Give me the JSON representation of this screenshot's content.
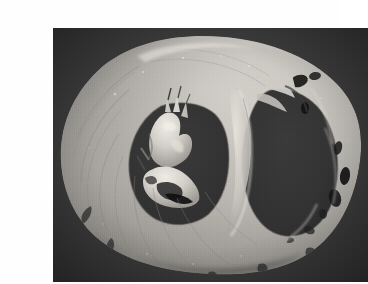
{
  "page": {
    "background_color": "#fefefe"
  },
  "figure": {
    "kind": "photograph",
    "modality": "gross-pathology-specimen-photograph",
    "color_mode": "grayscale",
    "caption": "",
    "alt_text": "Grayscale gross pathology photograph of a transverse (short-axis) slice of a heart, showing the thick-walled left ventricle with a central cavity and papillary muscle, and the thinner-walled, trabeculated right ventricle to the right, photographed against a plain dark gray background.",
    "frame": {
      "x": 13,
      "y": 12,
      "width": 315,
      "height": 254
    },
    "palette": {
      "background": "#3b3b3b",
      "cavity_dark": "#363636",
      "recess_black": "#111111",
      "tissue_mid": "#b4b2ad",
      "tissue_light": "#d5d3cd",
      "tissue_highlight": "#ece9e3",
      "tissue_shadow": "#8d8b86",
      "endocardium_gray": "#7c7a75"
    },
    "structures": [
      {
        "name": "left-ventricle-free-wall",
        "label": "Left ventricular free wall (thick myocardium)"
      },
      {
        "name": "left-ventricle-cavity",
        "label": "Left ventricular cavity"
      },
      {
        "name": "papillary-muscle-group",
        "label": "Papillary muscles / chordae in left ventricle"
      },
      {
        "name": "interventricular-septum",
        "label": "Interventricular septum"
      },
      {
        "name": "right-ventricle-cavity",
        "label": "Right ventricular cavity"
      },
      {
        "name": "right-ventricle-free-wall",
        "label": "Right ventricular free wall (thin, trabeculated)"
      },
      {
        "name": "trabeculae-carneae",
        "label": "Trabeculae carneae and intertrabecular recesses"
      },
      {
        "name": "epicardial-surface",
        "label": "Outer epicardial surface"
      }
    ]
  }
}
